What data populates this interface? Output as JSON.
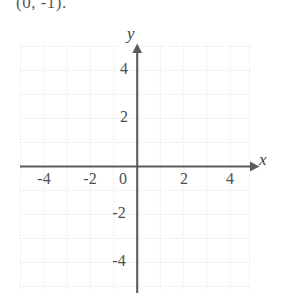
{
  "prompt": {
    "text": "(0,  -1)."
  },
  "graph": {
    "title": "",
    "axis_labels": {
      "x": "x",
      "y": "y"
    },
    "origin_label": "0",
    "x_ticks": [
      {
        "value": -4,
        "label": "-4"
      },
      {
        "value": -2,
        "label": "-2"
      },
      {
        "value": 2,
        "label": "2"
      },
      {
        "value": 4,
        "label": "4"
      }
    ],
    "y_ticks": [
      {
        "value": 4,
        "label": "4"
      },
      {
        "value": 2,
        "label": "2"
      },
      {
        "value": -2,
        "label": "-2"
      },
      {
        "value": -4,
        "label": "-4"
      }
    ],
    "x_range": [
      -5,
      5
    ],
    "y_range": [
      -5.2,
      5.1
    ],
    "grid": "dotted",
    "grid_step": 1,
    "colors": {
      "axis": "#58585a",
      "grid": "#d8d8dc",
      "grid_major": "#e6e6ea",
      "text": "#4d4d4f",
      "background": "#ffffff"
    },
    "plotted_points": [],
    "plotted_curves": []
  }
}
